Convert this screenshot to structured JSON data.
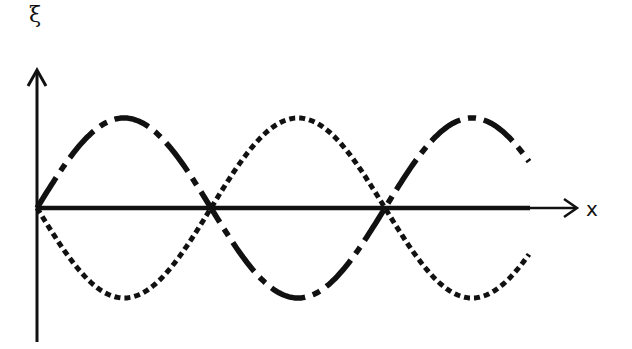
{
  "labels": {
    "y_axis": "ξ",
    "x_axis": "x"
  },
  "colors": {
    "ink": "#111111",
    "background": "#ffffff"
  },
  "chart_data": {
    "type": "line",
    "title": "",
    "xlabel": "x",
    "ylabel": "ξ",
    "grid": false,
    "legend": null,
    "series": [
      {
        "name": "wave-dash-dot",
        "style": "dash-dot",
        "function": "sin(kx)",
        "amplitude": 1,
        "phase": 0
      },
      {
        "name": "wave-dotted",
        "style": "dotted",
        "function": "-sin(kx)",
        "amplitude": 1,
        "phase": 180
      }
    ],
    "x_extent_wavelengths": 1.42,
    "zero_crossings_half_wavelengths": [
      0,
      1,
      2
    ],
    "annotations": []
  }
}
